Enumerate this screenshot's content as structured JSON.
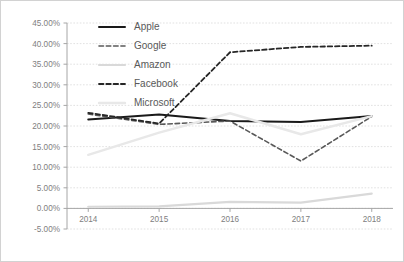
{
  "chart_data": {
    "type": "line",
    "title": "",
    "xlabel": "",
    "ylabel": "",
    "categories": [
      "2014",
      "2015",
      "2016",
      "2017",
      "2018"
    ],
    "x": [
      2014,
      2015,
      2016,
      2017,
      2018
    ],
    "ylim": [
      -5,
      45
    ],
    "yticks": [
      "-5.00%",
      "0.00%",
      "5.00%",
      "10.00%",
      "15.00%",
      "20.00%",
      "25.00%",
      "30.00%",
      "35.00%",
      "40.00%",
      "45.00%"
    ],
    "ytick_values": [
      -5,
      0,
      5,
      10,
      15,
      20,
      25,
      30,
      35,
      40,
      45
    ],
    "grid": true,
    "legend_position": "top-center-inside",
    "series": [
      {
        "name": "Apple",
        "values": [
          21.6,
          22.8,
          21.2,
          21.0,
          22.4
        ],
        "color": "#1a1a1a",
        "style": "solid",
        "width": 2.0
      },
      {
        "name": "Google",
        "values": [
          22.9,
          20.4,
          21.2,
          11.5,
          22.3
        ],
        "color": "#595959",
        "style": "dashed",
        "width": 1.6
      },
      {
        "name": "Amazon",
        "values": [
          0.4,
          0.5,
          1.6,
          1.4,
          3.6
        ],
        "color": "#d9d9d9",
        "style": "solid",
        "width": 2.2
      },
      {
        "name": "Facebook",
        "values": [
          23.2,
          20.6,
          37.9,
          39.2,
          39.5
        ],
        "color": "#262626",
        "style": "dashed",
        "width": 1.8
      },
      {
        "name": "Microsoft",
        "values": [
          13.0,
          18.4,
          23.1,
          18.0,
          22.4
        ],
        "color": "#e8e8e8",
        "style": "solid",
        "width": 2.4
      }
    ]
  },
  "legend": {
    "items": [
      {
        "label": "Apple"
      },
      {
        "label": "Google"
      },
      {
        "label": "Amazon"
      },
      {
        "label": "Facebook"
      },
      {
        "label": "Microsoft"
      }
    ]
  }
}
